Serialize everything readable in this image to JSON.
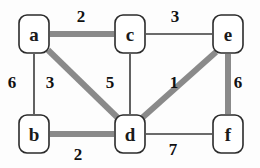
{
  "figure": {
    "kind": "weighted-undirected-graph",
    "background_color": "#fdfdfd",
    "node_shape": "rounded-rectangle",
    "node_stroke_color": "#2b2b2b",
    "node_fill_color": "#ffffff",
    "thin_edge_color": "#3a3a3a",
    "thick_edge_color": "#8a8a8a",
    "thin_edge_width": 1.6,
    "thick_edge_width": 6,
    "label_color": "#111111"
  },
  "nodes": [
    {
      "id": "a",
      "label": "a",
      "cx": 34,
      "cy": 34,
      "w": 30,
      "h": 38
    },
    {
      "id": "c",
      "label": "c",
      "cx": 130,
      "cy": 34,
      "w": 30,
      "h": 38
    },
    {
      "id": "e",
      "label": "e",
      "cx": 228,
      "cy": 34,
      "w": 30,
      "h": 38
    },
    {
      "id": "b",
      "label": "b",
      "cx": 34,
      "cy": 134,
      "w": 30,
      "h": 38
    },
    {
      "id": "d",
      "label": "d",
      "cx": 130,
      "cy": 134,
      "w": 30,
      "h": 38
    },
    {
      "id": "f",
      "label": "f",
      "cx": 228,
      "cy": 134,
      "w": 30,
      "h": 38
    }
  ],
  "edges": [
    {
      "id": "a-c",
      "from": "a",
      "to": "c",
      "weight": "2",
      "highlighted": true,
      "x1": 50,
      "y1": 34,
      "x2": 114,
      "y2": 34,
      "label_x": 81,
      "label_y": 8
    },
    {
      "id": "c-e",
      "from": "c",
      "to": "e",
      "weight": "3",
      "highlighted": false,
      "x1": 146,
      "y1": 34,
      "x2": 212,
      "y2": 34,
      "label_x": 175,
      "label_y": 8
    },
    {
      "id": "a-b",
      "from": "a",
      "to": "b",
      "weight": "6",
      "highlighted": false,
      "x1": 34,
      "y1": 54,
      "x2": 34,
      "y2": 114,
      "label_x": 12,
      "label_y": 74
    },
    {
      "id": "a-d",
      "from": "a",
      "to": "d",
      "weight": "3",
      "highlighted": true,
      "x1": 48,
      "y1": 50,
      "x2": 118,
      "y2": 118,
      "label_x": 50,
      "label_y": 74
    },
    {
      "id": "c-d",
      "from": "c",
      "to": "d",
      "weight": "5",
      "highlighted": false,
      "x1": 130,
      "y1": 54,
      "x2": 130,
      "y2": 114,
      "label_x": 110,
      "label_y": 74
    },
    {
      "id": "d-e",
      "from": "d",
      "to": "e",
      "weight": "1",
      "highlighted": true,
      "x1": 142,
      "y1": 118,
      "x2": 216,
      "y2": 52,
      "label_x": 174,
      "label_y": 74
    },
    {
      "id": "e-f",
      "from": "e",
      "to": "f",
      "weight": "6",
      "highlighted": true,
      "x1": 228,
      "y1": 54,
      "x2": 228,
      "y2": 114,
      "label_x": 238,
      "label_y": 74
    },
    {
      "id": "b-d",
      "from": "b",
      "to": "d",
      "weight": "2",
      "highlighted": true,
      "x1": 50,
      "y1": 134,
      "x2": 114,
      "y2": 134,
      "label_x": 78,
      "label_y": 146
    },
    {
      "id": "d-f",
      "from": "d",
      "to": "f",
      "weight": "7",
      "highlighted": false,
      "x1": 146,
      "y1": 134,
      "x2": 212,
      "y2": 134,
      "label_x": 173,
      "label_y": 141
    }
  ]
}
